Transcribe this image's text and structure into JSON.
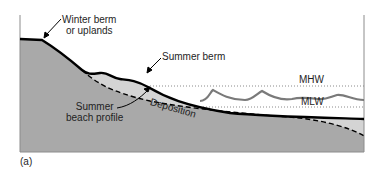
{
  "figure": {
    "panel_label": "(a)",
    "labels": {
      "winter_berm_line1": "Winter berm",
      "winter_berm_line2": "or uplands",
      "summer_berm": "Summer berm",
      "summer_profile_line1": "Summer",
      "summer_profile_line2": "beach profile",
      "deposition": "Deposition",
      "mhw": "MHW",
      "mlw": "MLW"
    },
    "colors": {
      "upland_fill": "#a9a9a9",
      "deposition_fill": "#d4d4d4",
      "profile_line": "#000000",
      "wave_line": "#7a7a7a",
      "tide_line": "#8a8a8a",
      "frame": "#8c8c8c"
    }
  }
}
